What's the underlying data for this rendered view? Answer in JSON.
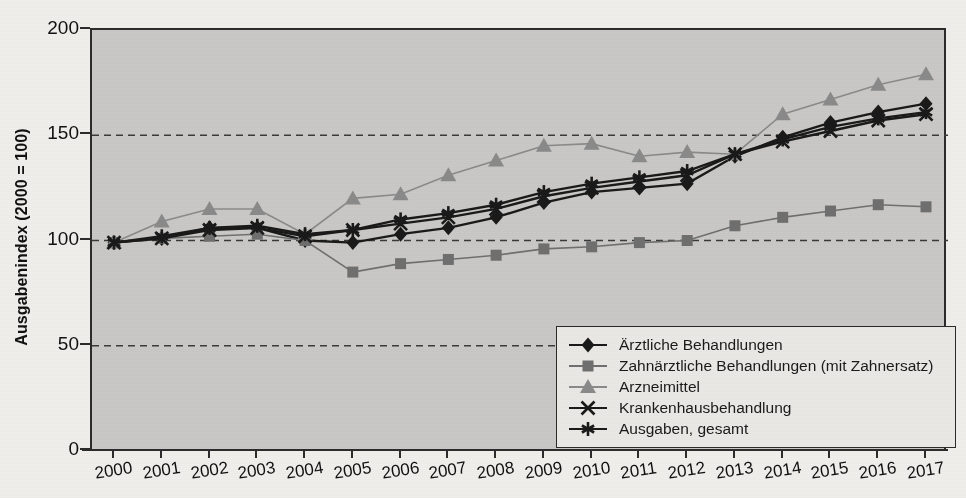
{
  "chart_data": {
    "type": "line",
    "title": "",
    "xlabel": "",
    "ylabel": "Ausgabenindex (2000 = 100)",
    "ylim": [
      0,
      200
    ],
    "yticks": [
      0,
      50,
      100,
      150,
      200
    ],
    "grid": true,
    "legend_position": "bottom-right",
    "categories": [
      "2000",
      "2001",
      "2002",
      "2003",
      "2004",
      "2005",
      "2006",
      "2007",
      "2008",
      "2009",
      "2010",
      "2011",
      "2012",
      "2013",
      "2014",
      "2015",
      "2016",
      "2017"
    ],
    "series": [
      {
        "name": "Ärztliche Behandlungen",
        "marker": "diamond",
        "color": "#1a1a1a",
        "values": [
          99,
          101,
          106,
          106,
          100,
          99,
          103,
          106,
          111,
          118,
          123,
          125,
          127,
          140,
          149,
          156,
          161,
          165
        ]
      },
      {
        "name": "Zahnärztliche Behandlungen (mit Zahnersatz)",
        "marker": "square",
        "color": "#6f6f6f",
        "values": [
          99,
          101,
          102,
          103,
          100,
          85,
          89,
          91,
          93,
          96,
          97,
          99,
          100,
          107,
          111,
          114,
          117,
          116
        ]
      },
      {
        "name": "Arzneimittel",
        "marker": "triangle",
        "color": "#8a8a8a",
        "values": [
          99,
          109,
          115,
          115,
          103,
          120,
          122,
          131,
          138,
          145,
          146,
          140,
          142,
          141,
          160,
          167,
          174,
          179
        ]
      },
      {
        "name": "Krankenhausbehandlung",
        "marker": "cross",
        "color": "#1a1a1a",
        "values": [
          99,
          101,
          105,
          106,
          102,
          105,
          108,
          111,
          115,
          121,
          125,
          128,
          131,
          141,
          147,
          152,
          157,
          160
        ]
      },
      {
        "name": "Ausgaben, gesamt",
        "marker": "asterisk",
        "color": "#1a1a1a",
        "values": [
          99,
          102,
          106,
          107,
          103,
          105,
          110,
          113,
          117,
          123,
          127,
          130,
          133,
          141,
          148,
          154,
          158,
          161
        ]
      }
    ]
  },
  "legend": {
    "items": [
      {
        "label": "Ärztliche Behandlungen",
        "marker": "diamond"
      },
      {
        "label": "Zahnärztliche Behandlungen (mit Zahnersatz)",
        "marker": "square"
      },
      {
        "label": "Arzneimittel",
        "marker": "triangle"
      },
      {
        "label": "Krankenhausbehandlung",
        "marker": "cross"
      },
      {
        "label": "Ausgaben, gesamt",
        "marker": "asterisk"
      }
    ]
  },
  "colors": {
    "plot_background": "#c9c8c6",
    "page_background": "#efeeea",
    "axis": "#2b2b2b",
    "grid": "#3a3a3a",
    "dark_series": "#1a1a1a",
    "mid_series": "#6f6f6f",
    "light_series": "#8a8a8a"
  }
}
